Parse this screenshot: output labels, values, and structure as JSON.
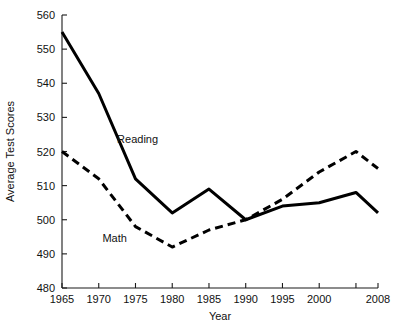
{
  "chart_data": {
    "type": "line",
    "title": "",
    "xlabel": "Year",
    "ylabel": "Average Test Scores",
    "x": [
      1965,
      1970,
      1975,
      1980,
      1985,
      1990,
      1995,
      2000,
      2005,
      2008
    ],
    "xtick_labels": [
      "1965",
      "1970",
      "1975",
      "1980",
      "1985",
      "1990",
      "1995",
      "2000",
      "",
      "2008"
    ],
    "ytick_labels": [
      "480",
      "490",
      "500",
      "510",
      "520",
      "530",
      "540",
      "550",
      "560"
    ],
    "xlim": [
      1965,
      2008
    ],
    "ylim": [
      480,
      560
    ],
    "grid": false,
    "legend_position": "inline-annotations",
    "series": [
      {
        "name": "Reading",
        "style": "solid",
        "color": "#000000",
        "values": [
          555,
          537,
          512,
          502,
          509,
          500,
          504,
          505,
          508,
          502
        ],
        "label_x": 1972.5,
        "label_y": 522.5
      },
      {
        "name": "Math",
        "style": "dashed",
        "color": "#000000",
        "values": [
          520,
          512,
          498,
          492,
          497,
          500,
          506,
          514,
          520,
          515
        ],
        "label_x": 1970.5,
        "label_y": 493.5
      }
    ]
  },
  "axis": {
    "y_title": "Average Test Scores",
    "x_title": "Year"
  },
  "ticks": {
    "y": [
      {
        "label": "560",
        "value": 560
      },
      {
        "label": "550",
        "value": 550
      },
      {
        "label": "540",
        "value": 540
      },
      {
        "label": "530",
        "value": 530
      },
      {
        "label": "520",
        "value": 520
      },
      {
        "label": "510",
        "value": 510
      },
      {
        "label": "500",
        "value": 500
      },
      {
        "label": "490",
        "value": 490
      },
      {
        "label": "480",
        "value": 480
      }
    ],
    "x": [
      {
        "label": "1965",
        "value": 1965
      },
      {
        "label": "1970",
        "value": 1970
      },
      {
        "label": "1975",
        "value": 1975
      },
      {
        "label": "1980",
        "value": 1980
      },
      {
        "label": "1985",
        "value": 1985
      },
      {
        "label": "1990",
        "value": 1990
      },
      {
        "label": "1995",
        "value": 1995
      },
      {
        "label": "2000",
        "value": 2000
      },
      {
        "label": "",
        "value": 2005
      },
      {
        "label": "2008",
        "value": 2008
      }
    ]
  }
}
